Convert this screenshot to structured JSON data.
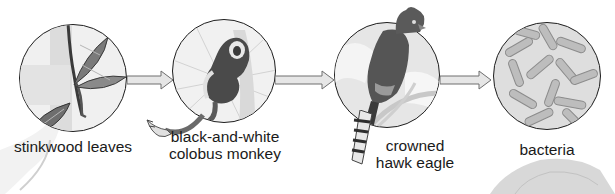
{
  "diagram": {
    "type": "food-chain",
    "nodes": [
      {
        "id": "stinkwood",
        "label_line1": "stinkwood leaves",
        "label_line2": "",
        "icon": "leaf-branch-icon"
      },
      {
        "id": "colobus",
        "label_line1": "black-and-white",
        "label_line2": "colobus monkey",
        "icon": "monkey-icon"
      },
      {
        "id": "eagle",
        "label_line1": "crowned",
        "label_line2": "hawk eagle",
        "icon": "eagle-icon"
      },
      {
        "id": "bacteria",
        "label_line1": "bacteria",
        "label_line2": "",
        "icon": "bacteria-icon"
      }
    ],
    "edges": [
      {
        "from": "stinkwood",
        "to": "colobus",
        "icon": "arrow-right-icon"
      },
      {
        "from": "colobus",
        "to": "eagle",
        "icon": "arrow-right-icon"
      },
      {
        "from": "eagle",
        "to": "bacteria",
        "icon": "arrow-right-icon"
      }
    ],
    "colors": {
      "outline": "#1e1e1e",
      "arrow_fill": "#e6e6e6",
      "arrow_stroke": "#6e6e6e",
      "circle_bg": "#ececec",
      "text": "#1a1a1a"
    }
  }
}
